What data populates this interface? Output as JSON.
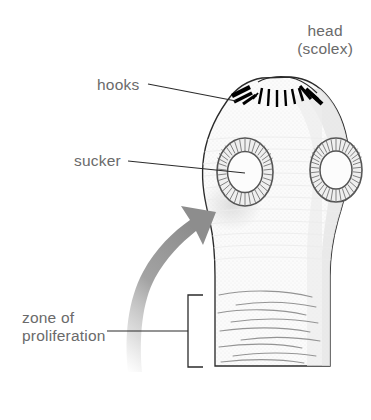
{
  "diagram": {
    "background_color": "#ffffff",
    "label_color": "#6a6a6a",
    "leader_line_color": "#2b2b2b",
    "outline_color": "#2b2b2b",
    "body_fill": "#fbfbfb",
    "body_shade": "#e4e4e4",
    "hook_color": "#000000",
    "arrow_color": "#9a9a9a",
    "sucker_ring_color": "#555555"
  },
  "labels": {
    "head": {
      "line1": "head",
      "line2": "(scolex)"
    },
    "hooks": "hooks",
    "sucker": "sucker",
    "zone": {
      "line1": "zone of",
      "line2": "proliferation"
    }
  },
  "parts": {
    "scolex": "scolex-head",
    "hooks": "hook-crown",
    "sucker_left": "sucker-left",
    "sucker_right": "sucker-right",
    "neck": "neck",
    "strobila": "proliferation-segments",
    "arrow": "growth-direction-arrow",
    "bracket": "zone-bracket"
  }
}
